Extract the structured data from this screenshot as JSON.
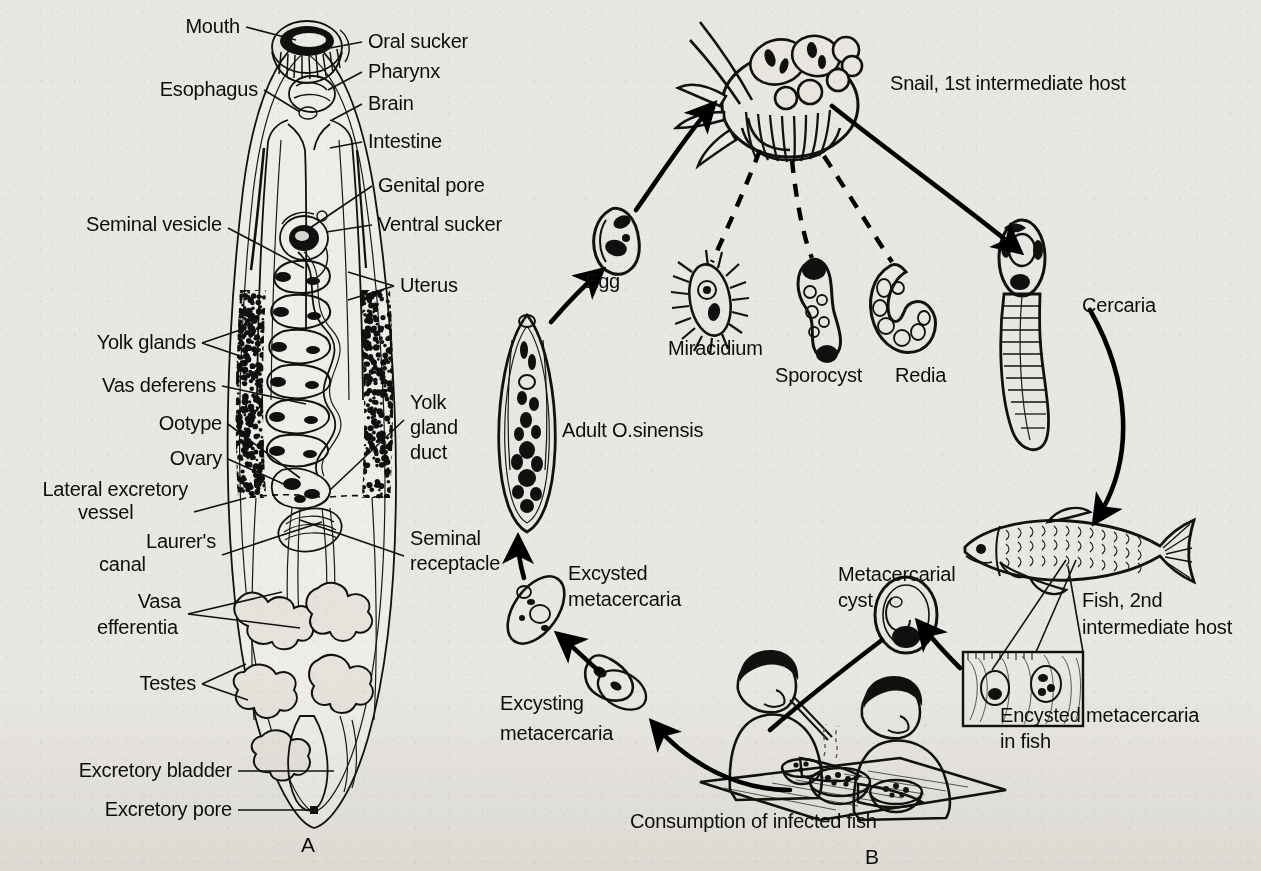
{
  "figure": {
    "panels": [
      {
        "id": "A",
        "letter": "A",
        "title": "Adult fluke anatomy"
      },
      {
        "id": "B",
        "letter": "B",
        "title": "Life cycle"
      }
    ]
  },
  "panel_a": {
    "letter": "A",
    "labels": [
      {
        "id": "mouth",
        "text": "Mouth",
        "x": 240,
        "y": 33,
        "anchor": "end"
      },
      {
        "id": "oral-sucker",
        "text": "Oral sucker",
        "x": 368,
        "y": 48,
        "anchor": "start"
      },
      {
        "id": "pharynx",
        "text": "Pharynx",
        "x": 368,
        "y": 78,
        "anchor": "start"
      },
      {
        "id": "esophagus",
        "text": "Esophagus",
        "x": 258,
        "y": 96,
        "anchor": "end"
      },
      {
        "id": "brain",
        "text": "Brain",
        "x": 368,
        "y": 110,
        "anchor": "start"
      },
      {
        "id": "intestine",
        "text": "Intestine",
        "x": 368,
        "y": 148,
        "anchor": "start"
      },
      {
        "id": "genital-pore",
        "text": "Genital pore",
        "x": 378,
        "y": 192,
        "anchor": "start"
      },
      {
        "id": "ventral-sucker",
        "text": "Ventral sucker",
        "x": 378,
        "y": 231,
        "anchor": "start"
      },
      {
        "id": "seminal-vesicle",
        "text": "Seminal vesicle",
        "x": 222,
        "y": 231,
        "anchor": "end"
      },
      {
        "id": "uterus",
        "text": "Uterus",
        "x": 400,
        "y": 292,
        "anchor": "start"
      },
      {
        "id": "yolk-glands",
        "text": "Yolk glands",
        "x": 196,
        "y": 349,
        "anchor": "end"
      },
      {
        "id": "vas-deferens",
        "text": "Vas deferens",
        "x": 216,
        "y": 392,
        "anchor": "end"
      },
      {
        "id": "ootype",
        "text": "Ootype",
        "x": 222,
        "y": 430,
        "anchor": "end"
      },
      {
        "id": "ovary",
        "text": "Ovary",
        "x": 222,
        "y": 465,
        "anchor": "end"
      },
      {
        "id": "lateral-excretory-vessel-1",
        "text": "Lateral excretory",
        "x": 188,
        "y": 496,
        "anchor": "end"
      },
      {
        "id": "lateral-excretory-vessel-2",
        "text": "vessel",
        "x": 78,
        "y": 519,
        "anchor": "start"
      },
      {
        "id": "laurers-canal-1",
        "text": "Laurer's",
        "x": 216,
        "y": 548,
        "anchor": "end"
      },
      {
        "id": "laurers-canal-2",
        "text": "canal",
        "x": 99,
        "y": 571,
        "anchor": "start"
      },
      {
        "id": "yolk-gland-duct-1",
        "text": "Yolk",
        "x": 410,
        "y": 409,
        "anchor": "start"
      },
      {
        "id": "yolk-gland-duct-2",
        "text": "gland",
        "x": 410,
        "y": 434,
        "anchor": "start"
      },
      {
        "id": "yolk-gland-duct-3",
        "text": "duct",
        "x": 410,
        "y": 459,
        "anchor": "start"
      },
      {
        "id": "seminal-receptacle-1",
        "text": "Seminal",
        "x": 410,
        "y": 545,
        "anchor": "start"
      },
      {
        "id": "seminal-receptacle-2",
        "text": "receptacle",
        "x": 410,
        "y": 570,
        "anchor": "start"
      },
      {
        "id": "vasa-efferentia-1",
        "text": "Vasa",
        "x": 181,
        "y": 608,
        "anchor": "end"
      },
      {
        "id": "vasa-efferentia-2",
        "text": "efferentia",
        "x": 97,
        "y": 634,
        "anchor": "start"
      },
      {
        "id": "testes",
        "text": "Testes",
        "x": 196,
        "y": 690,
        "anchor": "end"
      },
      {
        "id": "excretory-bladder",
        "text": "Excretory bladder",
        "x": 232,
        "y": 777,
        "anchor": "end"
      },
      {
        "id": "excretory-pore",
        "text": "Excretory pore",
        "x": 232,
        "y": 816,
        "anchor": "end"
      }
    ]
  },
  "panel_b": {
    "letter": "B",
    "labels": [
      {
        "id": "snail-host",
        "text": "Snail, 1st intermediate host",
        "x": 890,
        "y": 90,
        "anchor": "start"
      },
      {
        "id": "egg",
        "text": "Egg",
        "x": 585,
        "y": 288,
        "anchor": "start"
      },
      {
        "id": "miracidium",
        "text": "Miracidium",
        "x": 668,
        "y": 355,
        "anchor": "start"
      },
      {
        "id": "sporocyst",
        "text": "Sporocyst",
        "x": 775,
        "y": 382,
        "anchor": "start"
      },
      {
        "id": "redia",
        "text": "Redia",
        "x": 895,
        "y": 382,
        "anchor": "start"
      },
      {
        "id": "cercaria",
        "text": "Cercaria",
        "x": 1082,
        "y": 312,
        "anchor": "start"
      },
      {
        "id": "adult-o-sinensis",
        "text": "Adult O.sinensis",
        "x": 562,
        "y": 437,
        "anchor": "start"
      },
      {
        "id": "excysted-metacercaria-1",
        "text": "Excysted",
        "x": 568,
        "y": 580,
        "anchor": "start"
      },
      {
        "id": "excysted-metacercaria-2",
        "text": "metacercaria",
        "x": 568,
        "y": 606,
        "anchor": "start"
      },
      {
        "id": "excysting-metacercaria-1",
        "text": "Excysting",
        "x": 500,
        "y": 710,
        "anchor": "start"
      },
      {
        "id": "excysting-metacercaria-2",
        "text": "metacercaria",
        "x": 500,
        "y": 740,
        "anchor": "start"
      },
      {
        "id": "metacercarial-cyst-1",
        "text": "Metacercarial",
        "x": 838,
        "y": 581,
        "anchor": "start"
      },
      {
        "id": "metacercarial-cyst-2",
        "text": "cyst",
        "x": 838,
        "y": 607,
        "anchor": "start"
      },
      {
        "id": "fish-host-1",
        "text": "Fish, 2nd",
        "x": 1082,
        "y": 607,
        "anchor": "start"
      },
      {
        "id": "fish-host-2",
        "text": "intermediate host",
        "x": 1082,
        "y": 634,
        "anchor": "start"
      },
      {
        "id": "encysted-metacercaria-1",
        "text": "Encysted metacercaria",
        "x": 1000,
        "y": 722,
        "anchor": "start"
      },
      {
        "id": "encysted-metacercaria-2",
        "text": "in fish",
        "x": 1000,
        "y": 748,
        "anchor": "start"
      },
      {
        "id": "consumption",
        "text": "Consumption of infected fish",
        "x": 630,
        "y": 828,
        "anchor": "start"
      }
    ]
  },
  "colors": {
    "paper": "#e9e7e1",
    "ink": "#111111",
    "ink_light": "#9a968f"
  }
}
